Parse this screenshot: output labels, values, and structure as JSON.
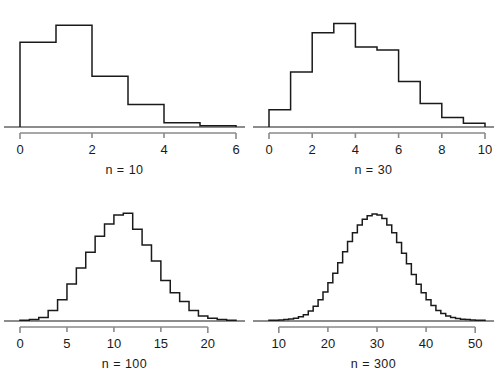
{
  "figure": {
    "background": "#ffffff",
    "line_color": "#1a1a1a",
    "axis_color": "#8a8a8a",
    "layout": "2x2 grid of histogram panels",
    "panel_order": [
      "n = 10",
      "n = 30",
      "n = 100",
      "n = 300"
    ]
  },
  "chart_data": [
    {
      "type": "bar",
      "title": "",
      "subtitle": "",
      "xlabel": "n = 10",
      "ylabel": "",
      "grid": false,
      "legend": null,
      "axis_ticks": [
        0,
        2,
        4,
        6
      ],
      "tick_labels": [
        "0",
        "2",
        "4",
        "6"
      ],
      "xlim": [
        0,
        6
      ],
      "bin_width": 1,
      "bin_left_edges": [
        0,
        1,
        2,
        3,
        4,
        5
      ],
      "categories": [
        "0-1",
        "1-2",
        "2-3",
        "3-4",
        "4-5",
        "5-6"
      ],
      "values": [
        0.3,
        0.36,
        0.18,
        0.08,
        0.015,
        0.004
      ],
      "ylim": [
        0,
        0.4
      ],
      "note": "frequency histogram outline, heights read as relative density"
    },
    {
      "type": "bar",
      "title": "",
      "subtitle": "",
      "xlabel": "n = 30",
      "ylabel": "",
      "grid": false,
      "legend": null,
      "axis_ticks": [
        0,
        2,
        4,
        6,
        8,
        10
      ],
      "tick_labels": [
        "0",
        "2",
        "4",
        "6",
        "8",
        "10"
      ],
      "xlim": [
        0,
        10
      ],
      "bin_width": 1,
      "bin_left_edges": [
        0,
        1,
        2,
        3,
        4,
        5,
        6,
        7,
        8,
        9
      ],
      "categories": [
        "0-1",
        "1-2",
        "2-3",
        "3-4",
        "4-5",
        "5-6",
        "6-7",
        "7-8",
        "8-9",
        "9-10"
      ],
      "values": [
        0.055,
        0.175,
        0.3,
        0.33,
        0.255,
        0.245,
        0.145,
        0.075,
        0.03,
        0.012
      ],
      "ylim": [
        0,
        0.36
      ]
    },
    {
      "type": "bar",
      "title": "",
      "subtitle": "",
      "xlabel": "n = 100",
      "ylabel": "",
      "grid": false,
      "legend": null,
      "axis_ticks": [
        0,
        5,
        10,
        15,
        20
      ],
      "tick_labels": [
        "0",
        "5",
        "10",
        "15",
        "20"
      ],
      "xlim": [
        0,
        23
      ],
      "bin_width": 1,
      "bin_left_edges": [
        0,
        1,
        2,
        3,
        4,
        5,
        6,
        7,
        8,
        9,
        10,
        11,
        12,
        13,
        14,
        15,
        16,
        17,
        18,
        19,
        20,
        21,
        22
      ],
      "categories": [
        "0",
        "1",
        "2",
        "3",
        "4",
        "5",
        "6",
        "7",
        "8",
        "9",
        "10",
        "11",
        "12",
        "13",
        "14",
        "15",
        "16",
        "17",
        "18",
        "19",
        "20",
        "21",
        "22"
      ],
      "values": [
        0.002,
        0.004,
        0.01,
        0.03,
        0.06,
        0.105,
        0.15,
        0.195,
        0.24,
        0.275,
        0.3,
        0.305,
        0.26,
        0.215,
        0.17,
        0.115,
        0.08,
        0.055,
        0.03,
        0.014,
        0.008,
        0.004,
        0.002
      ],
      "ylim": [
        0,
        0.32
      ]
    },
    {
      "type": "bar",
      "title": "",
      "subtitle": "",
      "xlabel": "n = 300",
      "ylabel": "",
      "grid": false,
      "legend": null,
      "axis_ticks": [
        10,
        20,
        30,
        40,
        50
      ],
      "tick_labels": [
        "10",
        "20",
        "30",
        "40",
        "50"
      ],
      "xlim": [
        8,
        52
      ],
      "bin_width": 1,
      "bin_left_edges": [
        8,
        9,
        10,
        11,
        12,
        13,
        14,
        15,
        16,
        17,
        18,
        19,
        20,
        21,
        22,
        23,
        24,
        25,
        26,
        27,
        28,
        29,
        30,
        31,
        32,
        33,
        34,
        35,
        36,
        37,
        38,
        39,
        40,
        41,
        42,
        43,
        44,
        45,
        46,
        47,
        48,
        49,
        50,
        51
      ],
      "categories": [
        "8",
        "9",
        "10",
        "11",
        "12",
        "13",
        "14",
        "15",
        "16",
        "17",
        "18",
        "19",
        "20",
        "21",
        "22",
        "23",
        "24",
        "25",
        "26",
        "27",
        "28",
        "29",
        "30",
        "31",
        "32",
        "33",
        "34",
        "35",
        "36",
        "37",
        "38",
        "39",
        "40",
        "41",
        "42",
        "43",
        "44",
        "45",
        "46",
        "47",
        "48",
        "49",
        "50",
        "51"
      ],
      "values": [
        0.002,
        0.002,
        0.003,
        0.004,
        0.006,
        0.008,
        0.012,
        0.018,
        0.028,
        0.042,
        0.06,
        0.082,
        0.108,
        0.135,
        0.165,
        0.196,
        0.225,
        0.25,
        0.272,
        0.288,
        0.298,
        0.303,
        0.3,
        0.29,
        0.272,
        0.25,
        0.222,
        0.192,
        0.162,
        0.132,
        0.104,
        0.08,
        0.06,
        0.044,
        0.03,
        0.021,
        0.014,
        0.01,
        0.007,
        0.005,
        0.004,
        0.003,
        0.002,
        0.002
      ],
      "ylim": [
        0,
        0.32
      ]
    }
  ],
  "captions": {
    "panel1": "n = 10",
    "panel2": "n = 30",
    "panel3": "n = 100",
    "panel4": "n = 300"
  }
}
